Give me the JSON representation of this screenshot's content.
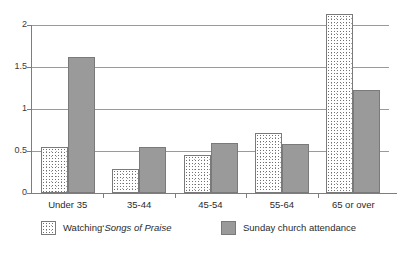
{
  "chart_data": {
    "type": "bar",
    "title": "",
    "subtitle": "",
    "xlabel": "",
    "ylabel": "",
    "categories": [
      "Under 35",
      "35-44",
      "45-54",
      "55-64",
      "65 or over"
    ],
    "series": [
      {
        "name": "Watching 'Songs of Praise",
        "name_plain": "Watching",
        "name_quote": "‘",
        "name_italic": "Songs of Praise",
        "fill": "stipple",
        "color": "#ffffff",
        "values": [
          0.55,
          0.29,
          0.45,
          0.71,
          2.13
        ]
      },
      {
        "name": "Sunday church attendance",
        "fill": "solid",
        "color": "#9a9a9a",
        "values": [
          1.62,
          0.55,
          0.6,
          0.58,
          1.23
        ]
      }
    ],
    "ylim": [
      0,
      2
    ],
    "yticks": [
      0,
      0.5,
      1,
      1.5,
      2
    ],
    "ytick_labels": [
      "0",
      "0.5",
      "1",
      "1.5",
      "2"
    ],
    "grid": true,
    "grid_axis": "y",
    "legend_position": "bottom"
  },
  "legend": {
    "entries": [
      {
        "prefix": "Watching",
        "quote": "‘",
        "italic_title": "Songs of Praise"
      },
      {
        "label": "Sunday church attendance"
      }
    ]
  },
  "axes": {
    "y_tick_labels": [
      "0",
      "0.5",
      "1",
      "1.5",
      "2"
    ],
    "x_category_labels": [
      "Under 35",
      "35-44",
      "45-54",
      "55-64",
      "65 or over"
    ]
  },
  "colors": {
    "bar_dark": "#9a9a9a",
    "bar_light": "#ffffff",
    "gridline": "#9a9a9a",
    "axis": "#7d7d7d",
    "text": "#2b2b2b",
    "background": "#ffffff"
  }
}
